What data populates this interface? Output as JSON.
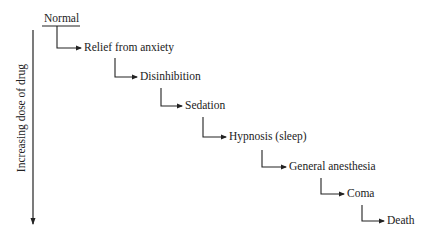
{
  "diagram": {
    "axis_label": "Increasing dose of drug",
    "start": "Normal",
    "steps": [
      {
        "label": "Relief from anxiety"
      },
      {
        "label": "Disinhibition"
      },
      {
        "label": "Sedation"
      },
      {
        "label": "Hypnosis (sleep)"
      },
      {
        "label": "General anesthesia"
      },
      {
        "label": "Coma"
      },
      {
        "label": "Death"
      }
    ]
  }
}
